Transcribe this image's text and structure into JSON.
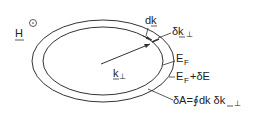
{
  "diagram": {
    "field_label": "H",
    "field_symbol": "out-of-plane-dot-icon",
    "wavevector_label": "k",
    "wavevector_sub": "⊥",
    "dk_label": "dk",
    "dkperp_label": "δk",
    "dkperp_sub": "⊥",
    "fermi_label": "E",
    "fermi_sub": "F",
    "fermi_plus_label_pre": "E",
    "fermi_plus_sub": "F",
    "fermi_plus_label_post": "+δE",
    "area_label": "δA=∮dk δk",
    "area_sub": "⊥",
    "line_color": "#333333"
  }
}
